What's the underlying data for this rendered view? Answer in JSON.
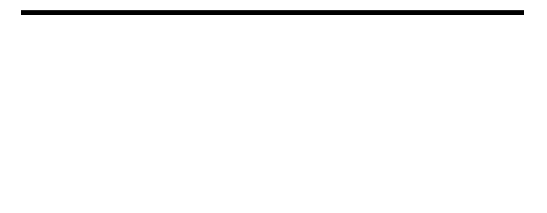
{
  "puzzle": {
    "type": "quote-falls",
    "columns": 17,
    "top_grid": {
      "rows": [
        [
          "",
          "",
          "",
          "#",
          "",
          "",
          "",
          "",
          "#",
          "",
          "",
          "",
          "",
          "",
          "#",
          "",
          ""
        ],
        [
          "#",
          "",
          "",
          "",
          "",
          "#",
          "",
          "",
          "#",
          "",
          "",
          "",
          "",
          "#",
          "",
          "",
          "#"
        ],
        [
          "",
          "",
          "",
          "",
          "#",
          "",
          "",
          "",
          "",
          "",
          "",
          "",
          "#",
          "#",
          "#",
          "#",
          "#"
        ]
      ]
    },
    "letter_rows": [
      [
        "F",
        "H",
        "A",
        "R",
        "E",
        "I",
        "L",
        "O",
        "E",
        "F",
        "E",
        "A",
        "N",
        "G",
        "I",
        "S",
        "E"
      ],
      [
        "T",
        "H",
        "A",
        "V",
        "O",
        "N",
        "T",
        "S",
        "",
        "L",
        "F",
        "I",
        "R",
        "",
        "",
        "W",
        ""
      ],
      [
        "",
        "E",
        "E",
        "",
        "",
        "",
        "T",
        "Y",
        "",
        "T",
        "H",
        ".",
        "",
        "",
        "",
        "",
        ""
      ]
    ]
  }
}
